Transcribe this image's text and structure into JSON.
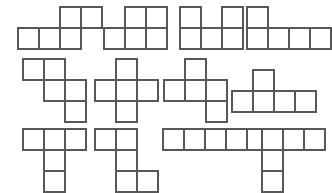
{
  "canvas": {
    "width": 329,
    "height": 191,
    "background_color": "#ffffff",
    "stroke_color": "#585858",
    "cell_size": 21,
    "description": "Worksheet sheet of twelve pentomino shapes arranged in three rows of four"
  },
  "figure": {
    "type": "shape-grid",
    "rows": 3,
    "columns": 4,
    "piece_count": 12,
    "squares_per_piece": 5
  },
  "shapes": [
    {
      "id": "shape-1",
      "name": "N-pentomino",
      "row": 1,
      "column": 1,
      "origin_x": 17,
      "origin_y": 6,
      "grid_width": 4,
      "grid_height": 2,
      "cells": [
        [
          2,
          0
        ],
        [
          3,
          0
        ],
        [
          0,
          1
        ],
        [
          1,
          1
        ],
        [
          2,
          1
        ]
      ]
    },
    {
      "id": "shape-2",
      "name": "P-pentomino",
      "row": 1,
      "column": 2,
      "origin_x": 103,
      "origin_y": 6,
      "grid_width": 3,
      "grid_height": 2,
      "cells": [
        [
          1,
          0
        ],
        [
          2,
          0
        ],
        [
          0,
          1
        ],
        [
          1,
          1
        ],
        [
          2,
          1
        ]
      ]
    },
    {
      "id": "shape-3",
      "name": "U-pentomino",
      "row": 1,
      "column": 3,
      "origin_x": 179,
      "origin_y": 6,
      "grid_width": 3,
      "grid_height": 2,
      "cells": [
        [
          0,
          0
        ],
        [
          2,
          0
        ],
        [
          0,
          1
        ],
        [
          1,
          1
        ],
        [
          2,
          1
        ]
      ]
    },
    {
      "id": "shape-4",
      "name": "L-pentomino",
      "row": 1,
      "column": 4,
      "origin_x": 246,
      "origin_y": 6,
      "grid_width": 4,
      "grid_height": 2,
      "cells": [
        [
          0,
          0
        ],
        [
          0,
          1
        ],
        [
          1,
          1
        ],
        [
          2,
          1
        ],
        [
          3,
          1
        ]
      ]
    },
    {
      "id": "shape-5",
      "name": "W-pentomino",
      "row": 2,
      "column": 1,
      "origin_x": 22,
      "origin_y": 58,
      "grid_width": 3,
      "grid_height": 3,
      "cells": [
        [
          0,
          0
        ],
        [
          1,
          0
        ],
        [
          1,
          1
        ],
        [
          2,
          1
        ],
        [
          2,
          2
        ]
      ]
    },
    {
      "id": "shape-6",
      "name": "X-pentomino",
      "row": 2,
      "column": 2,
      "origin_x": 94,
      "origin_y": 58,
      "grid_width": 3,
      "grid_height": 3,
      "cells": [
        [
          1,
          0
        ],
        [
          0,
          1
        ],
        [
          1,
          1
        ],
        [
          2,
          1
        ],
        [
          1,
          2
        ]
      ]
    },
    {
      "id": "shape-7",
      "name": "F-pentomino",
      "row": 2,
      "column": 3,
      "origin_x": 163,
      "origin_y": 58,
      "grid_width": 3,
      "grid_height": 3,
      "cells": [
        [
          1,
          0
        ],
        [
          0,
          1
        ],
        [
          1,
          1
        ],
        [
          2,
          1
        ],
        [
          2,
          2
        ]
      ]
    },
    {
      "id": "shape-8",
      "name": "Y-pentomino",
      "row": 2,
      "column": 4,
      "origin_x": 231,
      "origin_y": 69,
      "grid_width": 4,
      "grid_height": 2,
      "cells": [
        [
          1,
          0
        ],
        [
          0,
          1
        ],
        [
          1,
          1
        ],
        [
          2,
          1
        ],
        [
          3,
          1
        ]
      ]
    },
    {
      "id": "shape-9",
      "name": "T-pentomino",
      "row": 3,
      "column": 1,
      "origin_x": 22,
      "origin_y": 128,
      "grid_width": 3,
      "grid_height": 3,
      "cells": [
        [
          0,
          0
        ],
        [
          1,
          0
        ],
        [
          2,
          0
        ],
        [
          1,
          1
        ],
        [
          1,
          2
        ]
      ]
    },
    {
      "id": "shape-10",
      "name": "S-pentomino",
      "row": 3,
      "column": 2,
      "origin_x": 94,
      "origin_y": 128,
      "grid_width": 3,
      "grid_height": 3,
      "cells": [
        [
          0,
          0
        ],
        [
          1,
          0
        ],
        [
          1,
          1
        ],
        [
          1,
          2
        ],
        [
          2,
          2
        ]
      ]
    },
    {
      "id": "shape-11",
      "name": "I-pentomino",
      "row": 3,
      "column": 3,
      "origin_x": 162,
      "origin_y": 128,
      "grid_width": 5,
      "grid_height": 1,
      "cells": [
        [
          0,
          0
        ],
        [
          1,
          0
        ],
        [
          2,
          0
        ],
        [
          3,
          0
        ],
        [
          4,
          0
        ]
      ]
    },
    {
      "id": "shape-12",
      "name": "V-pentomino",
      "row": 3,
      "column": 4,
      "origin_x": 261,
      "origin_y": 128,
      "grid_width": 3,
      "grid_height": 3,
      "cells": [
        [
          0,
          0
        ],
        [
          1,
          0
        ],
        [
          2,
          0
        ],
        [
          0,
          1
        ],
        [
          0,
          2
        ]
      ]
    }
  ]
}
